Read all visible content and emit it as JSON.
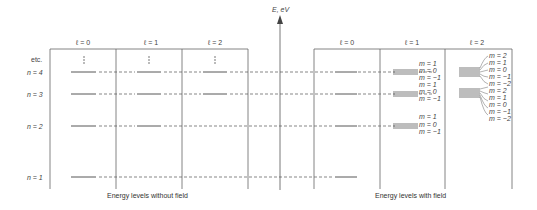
{
  "axis": {
    "label": "E, eV"
  },
  "left_panel": {
    "caption": "Energy levels without field",
    "columns": [
      "ℓ = 0",
      "ℓ = 1",
      "ℓ = 2"
    ]
  },
  "right_panel": {
    "caption": "Energy levels with field",
    "columns": [
      "ℓ = 0",
      "ℓ = 1",
      "ℓ = 2"
    ]
  },
  "row_labels": {
    "etc": "etc.",
    "n4": "n = 4",
    "n3": "n = 3",
    "n2": "n = 2",
    "n1": "n = 1"
  },
  "m_labels": {
    "l1_n4": [
      "m = 1",
      "m = 0",
      "m = −1"
    ],
    "l1_n3": [
      "m = 1",
      "m = 0",
      "m = −1"
    ],
    "l1_n2": [
      "m = 1",
      "m = 0",
      "m = −1"
    ],
    "l2_n4": [
      "m = 2",
      "m = 1",
      "m = 0",
      "m = −1",
      "m = −2"
    ],
    "l2_n3": [
      "m = 2",
      "m = 1",
      "m = 0",
      "m = −1",
      "m = −2"
    ]
  },
  "colors": {
    "line": "#555555",
    "text": "#444444"
  }
}
